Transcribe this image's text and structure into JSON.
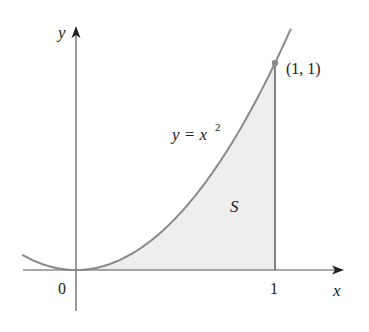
{
  "figure": {
    "curve_label": "y = x",
    "curve_exponent": "2",
    "region_label": "S",
    "point_label": "(1, 1)",
    "x_axis_label": "x",
    "y_axis_label": "y",
    "origin_label": "0",
    "x_tick_label": "1"
  },
  "colors": {
    "curve": "#8a8a8a",
    "axis": "#555555",
    "fill": "#eeeeee",
    "point": "#8a8a8a",
    "text": "#222222"
  },
  "chart_data": {
    "type": "area",
    "title": "",
    "function": "y = x^2",
    "shaded_region": {
      "label": "S",
      "x_from": 0,
      "x_to": 1,
      "bounded_by": [
        "y = x^2",
        "x-axis",
        "x = 1"
      ]
    },
    "highlighted_point": {
      "x": 1,
      "y": 1,
      "label": "(1, 1)"
    },
    "x": [
      -0.27,
      0,
      0.25,
      0.5,
      0.75,
      1,
      1.08
    ],
    "y": [
      0.07,
      0,
      0.0625,
      0.25,
      0.5625,
      1,
      1.17
    ],
    "xlabel": "x",
    "ylabel": "y",
    "x_ticks": [
      "0",
      "1"
    ],
    "grid": false,
    "legend": null
  }
}
